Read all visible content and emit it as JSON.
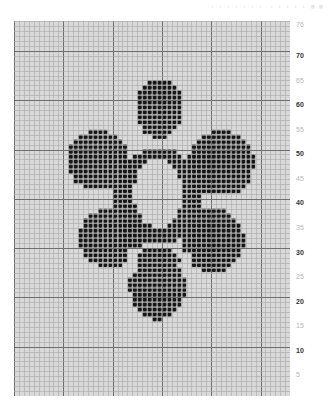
{
  "header": {
    "faint_text": "・・・・・・・ ・・・・・ ■ ■"
  },
  "grid": {
    "cols": 56,
    "rows": 76,
    "cell_px": 4.93,
    "major_every": 10,
    "colors": {
      "background": "#d9d9d9",
      "minor_line": "#a8a8a8",
      "major_line": "#6e6e6e",
      "stitch": "#151515",
      "stitch_shadow": "#5a5a5a"
    }
  },
  "pattern": {
    "name": "flower",
    "filled_shapes_px": [
      {
        "cx": 159,
        "cy": 108,
        "rx": 24,
        "ry": 30
      },
      {
        "cx": 98,
        "cy": 160,
        "rx": 32,
        "ry": 30
      },
      {
        "cx": 221,
        "cy": 163,
        "rx": 33,
        "ry": 33
      },
      {
        "cx": 110,
        "cy": 238,
        "rx": 32,
        "ry": 30
      },
      {
        "cx": 213,
        "cy": 240,
        "rx": 31,
        "ry": 32
      },
      {
        "cx": 158,
        "cy": 283,
        "rx": 29,
        "ry": 37
      },
      {
        "cx": 158,
        "cy": 196,
        "rx": 44,
        "ry": 48
      }
    ],
    "gaps_px": [
      {
        "cx": 128,
        "cy": 128,
        "rx": 7,
        "ry": 12
      },
      {
        "cx": 190,
        "cy": 128,
        "rx": 7,
        "ry": 12
      },
      {
        "cx": 92,
        "cy": 200,
        "rx": 12,
        "ry": 6
      },
      {
        "cx": 226,
        "cy": 203,
        "rx": 12,
        "ry": 6
      },
      {
        "cx": 132,
        "cy": 262,
        "rx": 7,
        "ry": 14
      },
      {
        "cx": 186,
        "cy": 264,
        "rx": 7,
        "ry": 14
      }
    ],
    "hole_px": {
      "cx": 158,
      "cy": 193,
      "rx": 24,
      "ry": 34
    }
  },
  "row_labels": [
    {
      "text": "76",
      "y": 21,
      "bold": false
    },
    {
      "text": "70",
      "y": 52,
      "bold": true
    },
    {
      "text": "65",
      "y": 77,
      "bold": false
    },
    {
      "text": "60",
      "y": 101,
      "bold": true
    },
    {
      "text": "55",
      "y": 126,
      "bold": false
    },
    {
      "text": "50",
      "y": 150,
      "bold": true
    },
    {
      "text": "45",
      "y": 175,
      "bold": false
    },
    {
      "text": "40",
      "y": 199,
      "bold": true
    },
    {
      "text": "35",
      "y": 224,
      "bold": false
    },
    {
      "text": "30",
      "y": 249,
      "bold": true
    },
    {
      "text": "25",
      "y": 273,
      "bold": false
    },
    {
      "text": "20",
      "y": 298,
      "bold": true
    },
    {
      "text": "15",
      "y": 322,
      "bold": false
    },
    {
      "text": "10",
      "y": 347,
      "bold": true
    },
    {
      "text": "5",
      "y": 371,
      "bold": false
    }
  ]
}
